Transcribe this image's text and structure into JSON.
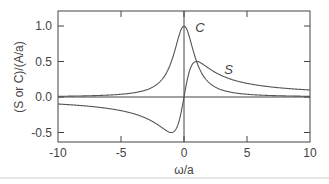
{
  "chart_data": {
    "type": "line",
    "title": "",
    "xlabel": "ω/a",
    "ylabel": "(S or C)/(A/a)",
    "xlim": [
      -10,
      10
    ],
    "ylim": [
      -0.6,
      1.2
    ],
    "xticks": [
      -10,
      -5,
      0,
      5,
      10
    ],
    "xtick_labels": [
      "-10",
      "-5",
      "0",
      "5",
      "10"
    ],
    "yticks": [
      -0.5,
      0.0,
      0.5,
      1.0
    ],
    "ytick_labels": [
      "-0.5",
      "0.0",
      "0.5",
      "1.0"
    ],
    "grid": false,
    "legend": "none (inline curve labels)",
    "annotations": [
      {
        "text": "C",
        "x": 0.9,
        "y": 0.92
      },
      {
        "text": "S",
        "x": 3.2,
        "y": 0.33
      }
    ],
    "reference_lines": [
      {
        "orientation": "horizontal",
        "value": 0.0
      },
      {
        "orientation": "vertical",
        "value": 0.0
      }
    ],
    "series": [
      {
        "name": "C",
        "formula": "1/(1+x^2)",
        "x": [
          -10,
          -8,
          -6,
          -4,
          -3,
          -2,
          -1.5,
          -1,
          -0.5,
          0,
          0.5,
          1,
          1.5,
          2,
          3,
          4,
          6,
          8,
          10
        ],
        "values": [
          0.01,
          0.015,
          0.027,
          0.059,
          0.1,
          0.2,
          0.308,
          0.5,
          0.8,
          1.0,
          0.8,
          0.5,
          0.308,
          0.2,
          0.1,
          0.059,
          0.027,
          0.015,
          0.01
        ]
      },
      {
        "name": "S",
        "formula": "x/(1+x^2)",
        "x": [
          -10,
          -8,
          -6,
          -4,
          -3,
          -2,
          -1.5,
          -1,
          -0.5,
          0,
          0.5,
          1,
          1.5,
          2,
          3,
          4,
          6,
          8,
          10
        ],
        "values": [
          -0.099,
          -0.123,
          -0.162,
          -0.235,
          -0.3,
          -0.4,
          -0.462,
          -0.5,
          -0.4,
          0.0,
          0.4,
          0.5,
          0.462,
          0.4,
          0.3,
          0.235,
          0.162,
          0.123,
          0.099
        ]
      }
    ]
  }
}
